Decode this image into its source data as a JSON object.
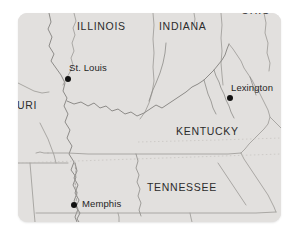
{
  "map": {
    "title": "Regional map of the central and southeastern United States",
    "background_color": "#ffffff",
    "land_color": "#e2e0de",
    "border_color": "#9a9894",
    "river_color": "#8d8b88",
    "label_color": "#2c2c2c",
    "city_dot_color": "#111111",
    "panel": {
      "x": 18,
      "y": 13,
      "width": 263,
      "height": 209,
      "corner_radius": 9
    },
    "state_labels": [
      {
        "name": "illinois",
        "text": "ILLINOIS",
        "x": 77,
        "y": 20,
        "clipped": false
      },
      {
        "name": "indiana",
        "text": "INDIANA",
        "x": 159,
        "y": 20,
        "clipped": false
      },
      {
        "name": "ohio",
        "text": "OHIO",
        "x": 241,
        "y": 4,
        "clipped": true
      },
      {
        "name": "missouri",
        "text": "URI",
        "x": 17,
        "y": 99,
        "clipped": true
      },
      {
        "name": "kentucky",
        "text": "KENTUCKY",
        "x": 176,
        "y": 125,
        "clipped": false
      },
      {
        "name": "tennessee",
        "text": "TENNESSEE",
        "x": 147,
        "y": 181,
        "clipped": false
      }
    ],
    "cities": [
      {
        "name": "st-louis",
        "text": "St. Louis",
        "label_x": 69,
        "label_y": 62,
        "dot_x": 65,
        "dot_y": 76
      },
      {
        "name": "lexington",
        "text": "Lexington",
        "label_x": 231,
        "label_y": 82,
        "dot_x": 227,
        "dot_y": 95
      },
      {
        "name": "memphis",
        "text": "Memphis",
        "label_x": 82,
        "label_y": 198,
        "dot_x": 71,
        "dot_y": 202
      }
    ]
  }
}
